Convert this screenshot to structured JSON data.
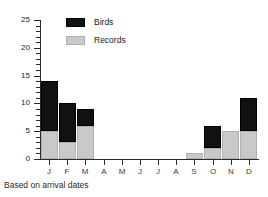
{
  "chart_data": {
    "type": "bar",
    "subtype": "stacked-vertical",
    "title": "",
    "subtitle": "",
    "xlabel": "",
    "ylabel": "",
    "categories": [
      "J",
      "F",
      "M",
      "A",
      "M",
      "J",
      "J",
      "A",
      "S",
      "O",
      "N",
      "D"
    ],
    "series": [
      {
        "name": "Records",
        "color": "#c9c9c9",
        "values": [
          5,
          3,
          6,
          0,
          0,
          0,
          0,
          0,
          1,
          2,
          5,
          5
        ]
      },
      {
        "name": "Birds",
        "color": "#111111",
        "values": [
          9,
          7,
          3,
          0,
          0,
          0,
          0,
          0,
          0,
          4,
          0,
          6
        ]
      }
    ],
    "totals": [
      14,
      10,
      9,
      0,
      0,
      0,
      0,
      0,
      1,
      6,
      5,
      11
    ],
    "ylim": [
      0,
      25
    ],
    "yticks": [
      0,
      5,
      10,
      15,
      20,
      25
    ],
    "ytick_labels": [
      "0",
      "5",
      "10",
      "15",
      "20",
      "25"
    ],
    "yminor_step": 1,
    "grid": false,
    "legend_position": "top-left-inside",
    "annotation": "Based on arrival dates"
  },
  "legend": {
    "items": [
      {
        "label": "Birds",
        "swatch": "black-swatch"
      },
      {
        "label": "Records",
        "swatch": "stippled-gray-swatch"
      }
    ]
  },
  "caption": {
    "text": "Based on arrival dates"
  }
}
